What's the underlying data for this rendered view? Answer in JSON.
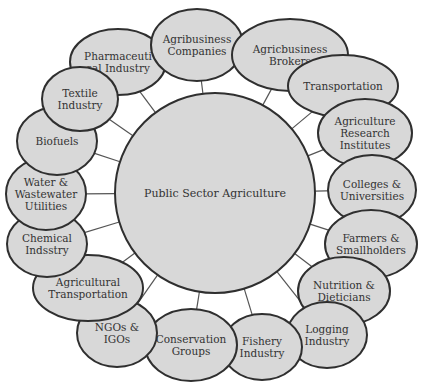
{
  "diagram": {
    "hub": {
      "label": "Public Sector Agriculture",
      "cx": 215,
      "cy": 193,
      "r": 100
    },
    "colors": {
      "fill": "#d8d8d8",
      "stroke": "#2f2f2f",
      "text": "#333333",
      "spoke": "#555555"
    },
    "nodes": [
      {
        "id": "pharmaceutical",
        "lines": [
          "Pharmaceuti",
          "cal Industry"
        ],
        "cx": 118,
        "cy": 62,
        "rx": 48,
        "ry": 33
      },
      {
        "id": "agribusiness-companies",
        "lines": [
          "Agribusiness",
          "Companies"
        ],
        "cx": 197,
        "cy": 45,
        "rx": 46,
        "ry": 36
      },
      {
        "id": "agricbusiness-brokers",
        "lines": [
          "Agricbusiness",
          "Brokers"
        ],
        "cx": 290,
        "cy": 55,
        "rx": 58,
        "ry": 36
      },
      {
        "id": "transportation",
        "lines": [
          "Transportation"
        ],
        "cx": 343,
        "cy": 86,
        "rx": 55,
        "ry": 31
      },
      {
        "id": "agriculture-research",
        "lines": [
          "Agriculture",
          "Research",
          "Institutes"
        ],
        "cx": 365,
        "cy": 133,
        "rx": 47,
        "ry": 34
      },
      {
        "id": "colleges",
        "lines": [
          "Colleges &",
          "Universities"
        ],
        "cx": 372,
        "cy": 190,
        "rx": 44,
        "ry": 35
      },
      {
        "id": "farmers",
        "lines": [
          "Farmers &",
          "Smallholders"
        ],
        "cx": 371,
        "cy": 244,
        "rx": 46,
        "ry": 34
      },
      {
        "id": "nutrition",
        "lines": [
          "Nutrition &",
          "Dieticians"
        ],
        "cx": 344,
        "cy": 291,
        "rx": 46,
        "ry": 34
      },
      {
        "id": "logging",
        "lines": [
          "Logging",
          "Industry"
        ],
        "cx": 327,
        "cy": 335,
        "rx": 40,
        "ry": 33
      },
      {
        "id": "fishery",
        "lines": [
          "Fishery",
          "Industry"
        ],
        "cx": 262,
        "cy": 347,
        "rx": 40,
        "ry": 33
      },
      {
        "id": "conservation",
        "lines": [
          "Conservation",
          "Groups"
        ],
        "cx": 191,
        "cy": 345,
        "rx": 46,
        "ry": 36
      },
      {
        "id": "ngos",
        "lines": [
          "NGOs &",
          "IGOs"
        ],
        "cx": 117,
        "cy": 333,
        "rx": 40,
        "ry": 34
      },
      {
        "id": "agricultural-transportation",
        "lines": [
          "Agricultural",
          "Transportation"
        ],
        "cx": 88,
        "cy": 288,
        "rx": 55,
        "ry": 33
      },
      {
        "id": "chemical",
        "lines": [
          "Chemical",
          "Indsstry"
        ],
        "cx": 47,
        "cy": 244,
        "rx": 40,
        "ry": 33
      },
      {
        "id": "water",
        "lines": [
          "Water &",
          "Wastewater",
          "Utilities"
        ],
        "cx": 46,
        "cy": 194,
        "rx": 40,
        "ry": 36
      },
      {
        "id": "biofuels",
        "lines": [
          "Biofuels"
        ],
        "cx": 57,
        "cy": 141,
        "rx": 40,
        "ry": 34
      },
      {
        "id": "textile",
        "lines": [
          "Textile",
          "Industry"
        ],
        "cx": 80,
        "cy": 99,
        "rx": 38,
        "ry": 32
      }
    ]
  }
}
